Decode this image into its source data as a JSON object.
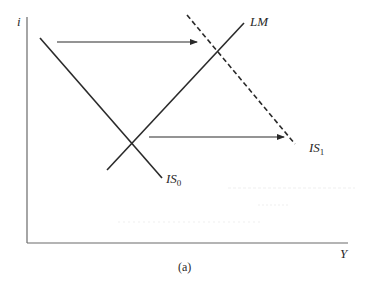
{
  "diagram": {
    "type": "IS-LM diagram",
    "caption": "(a)",
    "axes": {
      "y_label": "i",
      "x_label": "Y"
    },
    "curves": [
      {
        "id": "IS0",
        "label": "IS",
        "subscript": "0",
        "style": "solid",
        "slope": "downward"
      },
      {
        "id": "LM",
        "label": "LM",
        "subscript": "",
        "style": "solid",
        "slope": "upward"
      },
      {
        "id": "IS1",
        "label": "IS",
        "subscript": "1",
        "style": "dashed",
        "slope": "downward"
      }
    ],
    "arrows": [
      {
        "id": "shift-arrow-top",
        "direction": "right",
        "from_curve": "IS0",
        "to_curve": "IS1"
      },
      {
        "id": "shift-arrow-bottom",
        "direction": "right",
        "from_curve": "IS0",
        "to_curve": "IS1"
      }
    ],
    "colors": {
      "line": "#2a2a2a",
      "axis": "#6a6a6a",
      "background": "#ffffff"
    }
  }
}
